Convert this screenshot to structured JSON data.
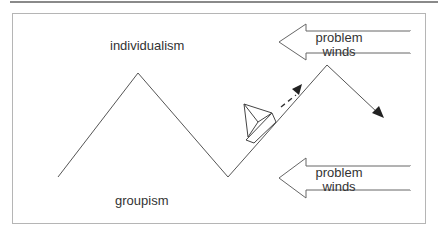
{
  "labels": {
    "top": "individualism",
    "bottom": "groupism"
  },
  "wind_arrows": [
    {
      "line1": "problem",
      "line2": "winds"
    },
    {
      "line1": "problem",
      "line2": "winds"
    }
  ],
  "colors": {
    "stroke": "#555555",
    "frame": "#b5b5b5",
    "text": "#333333"
  }
}
